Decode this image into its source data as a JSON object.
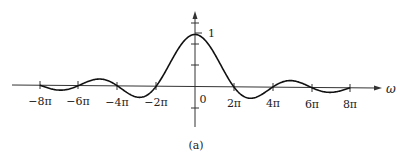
{
  "chart_data": {
    "type": "line",
    "title": "",
    "caption": "(a)",
    "xlabel": "ω",
    "ylabel": "",
    "function": "sin(ω/2)/(ω/2)",
    "x_tick_labels": [
      "−8π",
      "−6π",
      "−4π",
      "−2π",
      "0",
      "2π",
      "4π",
      "6π",
      "8π"
    ],
    "x_tick_values_in_pi": [
      -8,
      -6,
      -4,
      -2,
      0,
      2,
      4,
      6,
      8
    ],
    "y_tick_labels": [
      "1"
    ],
    "y_tick_values": [
      1
    ],
    "xlim_in_pi": [
      -8,
      8
    ],
    "ylim": [
      -0.35,
      1.25
    ],
    "grid": false,
    "legend": null,
    "series": [
      {
        "name": "sinc",
        "x_in_pi": [
          -8,
          -7,
          -6,
          -5,
          -4,
          -3,
          -2,
          -1,
          0,
          1,
          2,
          3,
          4,
          5,
          6,
          7,
          8
        ],
        "values": [
          0,
          -0.091,
          0,
          0.127,
          0,
          -0.212,
          0,
          0.637,
          1,
          0.637,
          0,
          -0.212,
          0,
          0.127,
          0,
          -0.091,
          0
        ]
      }
    ]
  },
  "labels": {
    "x_axis": "ω",
    "origin": "0",
    "y_one": "1",
    "caption": "(a)",
    "ticks": [
      "−8π",
      "−6π",
      "−4π",
      "−2π",
      "2π",
      "4π",
      "6π",
      "8π"
    ]
  }
}
